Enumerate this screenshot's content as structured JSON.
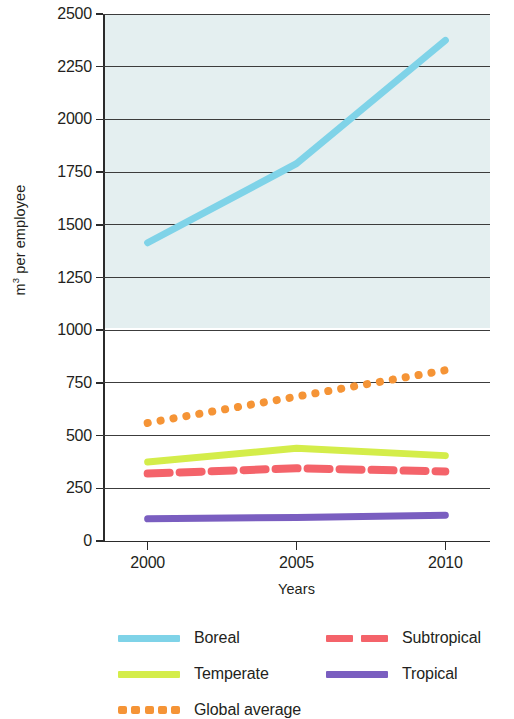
{
  "chart_data": {
    "type": "line",
    "title": "",
    "subtitle": "",
    "xlabel": "Years",
    "ylabel": "m³ per employee",
    "ylabel_html": "m<sup>3</sup> per employee",
    "x": [
      2000,
      2005,
      2010
    ],
    "xtick_labels": [
      "2000",
      "2005",
      "2010"
    ],
    "xlim": [
      1998.5,
      2011.5
    ],
    "ylim": [
      0,
      2500
    ],
    "yticks": [
      0,
      250,
      500,
      750,
      1000,
      1250,
      1500,
      1750,
      2000,
      2250,
      2500
    ],
    "ytick_labels": [
      "0",
      "250",
      "500",
      "750",
      "1000",
      "1250",
      "1500",
      "1750",
      "2000",
      "2250",
      "2500"
    ],
    "grid": "horizontal",
    "legend_position": "below",
    "series": [
      {
        "name": "Boreal",
        "color": "#7fd3e8",
        "style": "solid",
        "values": [
          1415,
          1790,
          2375
        ]
      },
      {
        "name": "Temperate",
        "color": "#d4ed4a",
        "style": "solid",
        "values": [
          375,
          440,
          405
        ]
      },
      {
        "name": "Global average",
        "color": "#f59436",
        "style": "dotted",
        "values": [
          560,
          685,
          810
        ]
      },
      {
        "name": "Subtropical",
        "color": "#f4636a",
        "style": "dashed",
        "values": [
          320,
          345,
          330
        ]
      },
      {
        "name": "Tropical",
        "color": "#7a5ec0",
        "style": "solid",
        "values": [
          105,
          112,
          122
        ]
      }
    ]
  },
  "legend": {
    "items": [
      {
        "label": "Boreal",
        "color": "#7fd3e8",
        "style": "solid",
        "icon": "line-swatch-icon"
      },
      {
        "label": "Subtropical",
        "color": "#f4636a",
        "style": "dashed",
        "icon": "dashed-line-swatch-icon"
      },
      {
        "label": "Temperate",
        "color": "#d4ed4a",
        "style": "solid",
        "icon": "line-swatch-icon"
      },
      {
        "label": "Tropical",
        "color": "#7a5ec0",
        "style": "solid",
        "icon": "line-swatch-icon"
      },
      {
        "label": "Global average",
        "color": "#f59436",
        "style": "dotted",
        "icon": "dotted-line-swatch-icon"
      }
    ]
  },
  "colors": {
    "boreal": "#7fd3e8",
    "temperate": "#d4ed4a",
    "global_average": "#f59436",
    "subtropical": "#f4636a",
    "tropical": "#7a5ec0",
    "gridline": "#3c3c3c",
    "plot_tint": "#e4eff0",
    "text": "#231f20"
  }
}
